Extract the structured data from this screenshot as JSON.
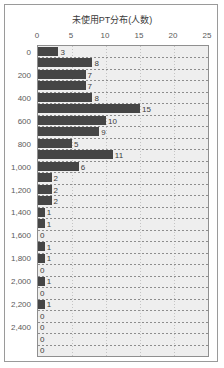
{
  "chart_data": {
    "type": "bar",
    "orientation": "horizontal",
    "title": "未使用PT分布(人数)",
    "xlabel": "",
    "ylabel": "",
    "xlim": [
      0,
      25
    ],
    "xticks": [
      0,
      5,
      10,
      15,
      20,
      25
    ],
    "xtick_labels": [
      "0",
      "5",
      "10",
      "15",
      "20",
      "25"
    ],
    "ytick_labels": [
      "0",
      "200",
      "400",
      "600",
      "800",
      "1,000",
      "1,200",
      "1,400",
      "1,600",
      "1,800",
      "2,000",
      "2,200",
      "2,400"
    ],
    "ytick_row_index": [
      0,
      2,
      4,
      6,
      8,
      10,
      12,
      14,
      16,
      18,
      20,
      22,
      24
    ],
    "categories": [
      "0",
      "100",
      "200",
      "300",
      "400",
      "500",
      "600",
      "700",
      "800",
      "900",
      "1,000",
      "1,100",
      "1,200",
      "1,300",
      "1,400",
      "1,500",
      "1,600",
      "1,700",
      "1,800",
      "1,900",
      "2,000",
      "2,100",
      "2,200",
      "2,300",
      "2,400",
      "2,500",
      "2,600"
    ],
    "values": [
      3,
      8,
      7,
      7,
      8,
      15,
      10,
      9,
      5,
      11,
      6,
      2,
      2,
      2,
      1,
      1,
      0,
      1,
      1,
      0,
      1,
      0,
      1,
      0,
      0,
      0,
      0
    ],
    "data_labels": [
      "3",
      "8",
      "7",
      "7",
      "8",
      "15",
      "10",
      "9",
      "5",
      "11",
      "6",
      "2",
      "2",
      "2",
      "1",
      "1",
      "0",
      "1",
      "1",
      "0",
      "1",
      "0",
      "1",
      "0",
      "0",
      "0",
      "0"
    ],
    "grid": true,
    "legend": false,
    "bar_color": "#454545",
    "plot_background": "#eeeeee",
    "frame_color": "#9a9a9a",
    "text_color": "#3c3c3c"
  }
}
